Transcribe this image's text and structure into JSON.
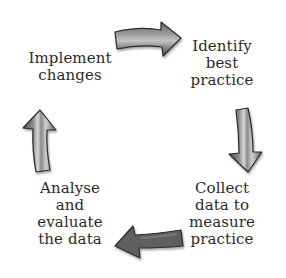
{
  "diagram": {
    "type": "cycle",
    "direction": "clockwise",
    "steps": [
      {
        "id": "identify",
        "label": "Identify\nbest\npractice"
      },
      {
        "id": "collect",
        "label": "Collect\ndata to\nmeasure\npractice"
      },
      {
        "id": "analyse",
        "label": "Analyse\nand\nevaluate\nthe data"
      },
      {
        "id": "implement",
        "label": "Implement\nchanges"
      }
    ],
    "arrows": [
      {
        "from": "implement",
        "to": "identify",
        "direction": "right"
      },
      {
        "from": "identify",
        "to": "collect",
        "direction": "down"
      },
      {
        "from": "collect",
        "to": "analyse",
        "direction": "left"
      },
      {
        "from": "analyse",
        "to": "implement",
        "direction": "up"
      }
    ],
    "colors": {
      "text": "#2b2b2b",
      "arrow_fill_dark": "#5a5a5a",
      "arrow_fill_light": "#b8b8b8",
      "arrow_outline": "#2a2a2a",
      "background": "#ffffff"
    }
  }
}
